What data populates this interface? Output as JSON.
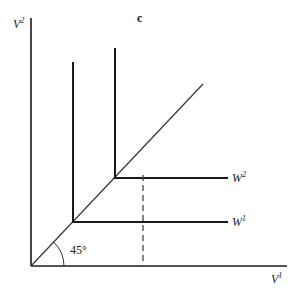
{
  "diagram": {
    "title_label": "c",
    "y_axis": {
      "label": "V",
      "sup": "2"
    },
    "x_axis": {
      "label": "V",
      "sup": "1"
    },
    "curves": [
      {
        "name": "W",
        "sup": "1"
      },
      {
        "name": "W",
        "sup": "2"
      }
    ],
    "angle_label": "45°",
    "colors": {
      "line": "#1a1a1a",
      "dashed": "#444444"
    }
  }
}
